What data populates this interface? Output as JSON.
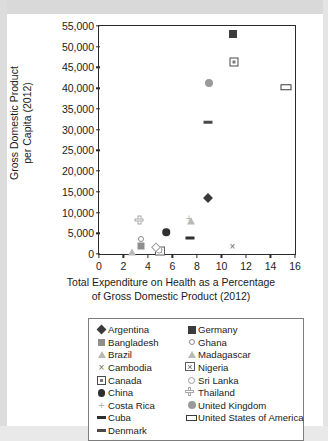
{
  "chart_data": {
    "type": "scatter",
    "title": "",
    "xlabel": "Total Expenditure on Health as a Percentage of Gross Domestic Product (2012)",
    "xlabel_line1": "Total Expenditure on Health as a Percentage",
    "xlabel_line2": "of Gross Domestic Product (2012)",
    "ylabel": "Gross Domestic Product per Capita (2012)",
    "ylabel_line1": "Gross Domestic Product",
    "ylabel_line2": "per Capita (2012)",
    "xlim": [
      0,
      16
    ],
    "ylim": [
      0,
      55000
    ],
    "xticks": [
      "0",
      "2",
      "4",
      "6",
      "8",
      "10",
      "12",
      "14",
      "16"
    ],
    "xtick_values": [
      0,
      2,
      4,
      6,
      8,
      10,
      12,
      14,
      16
    ],
    "yticks": [
      "0",
      "5,000",
      "10,000",
      "15,000",
      "20,000",
      "25,000",
      "30,000",
      "35,000",
      "40,000",
      "45,000",
      "50,000",
      "55,000"
    ],
    "ytick_values": [
      0,
      5000,
      10000,
      15000,
      20000,
      25000,
      30000,
      35000,
      40000,
      45000,
      50000,
      55000
    ],
    "grid": false,
    "legend_position": "bottom",
    "points": [
      {
        "name": "Argentina",
        "x": 8.9,
        "y": 13500,
        "marker": "diamond-filled"
      },
      {
        "name": "Bangladesh",
        "x": 3.4,
        "y": 2000,
        "marker": "square-gray"
      },
      {
        "name": "Brazil",
        "x": 2.7,
        "y": 600,
        "marker": "triangle-light"
      },
      {
        "name": "Cambodia",
        "x": 10.9,
        "y": 2000,
        "marker": "x"
      },
      {
        "name": "Canada",
        "x": 11.0,
        "y": 46200,
        "marker": "square-in-square"
      },
      {
        "name": "China",
        "x": 5.5,
        "y": 5300,
        "marker": "circle-filled"
      },
      {
        "name": "Costa Rica",
        "x": 7.35,
        "y": 8800,
        "marker": "plus"
      },
      {
        "name": "Cuba",
        "x": 7.4,
        "y": 3800,
        "marker": "dash"
      },
      {
        "name": "Denmark",
        "x": 8.9,
        "y": 31800,
        "marker": "dash2"
      },
      {
        "name": "Germany",
        "x": 10.9,
        "y": 53100,
        "marker": "square-dark"
      },
      {
        "name": "Ghana",
        "x": 3.4,
        "y": 3500,
        "marker": "circle-open-sm"
      },
      {
        "name": "Madagascar",
        "x": 7.5,
        "y": 8000,
        "marker": "triangle-light"
      },
      {
        "name": "Nigeria",
        "x": 5.0,
        "y": 800,
        "marker": "bowtie"
      },
      {
        "name": "Sri Lanka",
        "x": 4.9,
        "y": 900,
        "marker": "circle-open"
      },
      {
        "name": "Thailand",
        "x": 3.3,
        "y": 8200,
        "marker": "cross-plus"
      },
      {
        "name": "United Kingdom",
        "x": 9.0,
        "y": 41200,
        "marker": "circle-gray"
      },
      {
        "name": "United States of America",
        "x": 15.3,
        "y": 40200,
        "marker": "rect-open"
      },
      {
        "name": "Ghana-diamond",
        "x": 4.65,
        "y": 1600,
        "marker": "diamond-open"
      }
    ]
  },
  "legend": {
    "column_left": [
      {
        "label": "Argentina",
        "marker": "diamond-filled"
      },
      {
        "label": "Bangladesh",
        "marker": "square-gray"
      },
      {
        "label": "Brazil",
        "marker": "triangle-light"
      },
      {
        "label": "Cambodia",
        "marker": "x"
      },
      {
        "label": "Canada",
        "marker": "square-in-square"
      },
      {
        "label": "China",
        "marker": "circle-filled"
      },
      {
        "label": "Costa Rica",
        "marker": "plus"
      },
      {
        "label": "Cuba",
        "marker": "dash"
      },
      {
        "label": "Denmark",
        "marker": "dash2"
      }
    ],
    "column_right": [
      {
        "label": "Germany",
        "marker": "square-dark"
      },
      {
        "label": "Ghana",
        "marker": "circle-open-sm"
      },
      {
        "label": "Madagascar",
        "marker": "triangle-light"
      },
      {
        "label": "Nigeria",
        "marker": "bowtie"
      },
      {
        "label": "Sri Lanka",
        "marker": "circle-open"
      },
      {
        "label": "Thailand",
        "marker": "cross-plus"
      },
      {
        "label": "United Kingdom",
        "marker": "circle-gray"
      },
      {
        "label": "United States of America",
        "marker": "rect-open"
      }
    ]
  },
  "colors": {
    "axis": "#2b2b2b",
    "text": "#1b1b1b",
    "page_background": "#ffffff",
    "scan_edge": "#d9d9d9"
  }
}
